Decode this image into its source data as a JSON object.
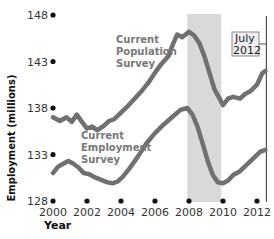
{
  "chart_data": {
    "type": "line",
    "title": "",
    "xlabel": "Year",
    "ylabel": "Employment (millions)",
    "xlim": [
      2000,
      2012.6
    ],
    "ylim": [
      128,
      148
    ],
    "x_ticks": [
      "2000",
      "2002",
      "2004",
      "2006",
      "2008",
      "2010",
      "2012"
    ],
    "y_ticks": [
      "128",
      "133",
      "138",
      "143",
      "148"
    ],
    "grid": false,
    "legend": "inline labels",
    "shaded_region": {
      "from": 2007.9,
      "to": 2009.9,
      "color": "#d9d9d9",
      "meaning": "recession"
    },
    "annotation": {
      "label_line1": "July",
      "label_line2": "2012",
      "x": 2012.55
    },
    "series": [
      {
        "name": "Current Population Survey",
        "label_line1": "Current",
        "label_line2": "Population",
        "label_line3": "Survey",
        "color": "#707070",
        "x": [
          2000.0,
          2000.4,
          2000.8,
          2001.1,
          2001.4,
          2001.7,
          2002.0,
          2002.3,
          2002.6,
          2003.0,
          2003.3,
          2003.6,
          2004.0,
          2004.4,
          2004.8,
          2005.2,
          2005.6,
          2006.0,
          2006.4,
          2006.8,
          2007.0,
          2007.3,
          2007.6,
          2008.0,
          2008.3,
          2008.6,
          2008.9,
          2009.2,
          2009.5,
          2009.8,
          2010.0,
          2010.3,
          2010.6,
          2011.0,
          2011.3,
          2011.6,
          2012.0,
          2012.3,
          2012.5
        ],
        "values": [
          137.0,
          136.6,
          137.0,
          136.5,
          137.3,
          136.5,
          135.8,
          136.0,
          135.6,
          136.1,
          136.6,
          136.8,
          137.5,
          138.2,
          139.0,
          139.8,
          140.7,
          141.8,
          142.8,
          143.6,
          144.6,
          145.9,
          145.6,
          146.2,
          145.8,
          145.0,
          143.6,
          141.8,
          140.0,
          139.0,
          138.3,
          139.0,
          139.2,
          139.0,
          139.5,
          139.8,
          140.5,
          141.7,
          142.0
        ]
      },
      {
        "name": "Current Employment Survey",
        "label_line1": "Current",
        "label_line2": "Employment",
        "label_line3": "Survey",
        "color": "#707070",
        "x": [
          2000.0,
          2000.3,
          2000.6,
          2000.9,
          2001.2,
          2001.5,
          2001.8,
          2002.1,
          2002.4,
          2002.8,
          2003.2,
          2003.5,
          2003.8,
          2004.1,
          2004.5,
          2005.0,
          2005.5,
          2006.0,
          2006.5,
          2007.0,
          2007.5,
          2007.9,
          2008.2,
          2008.5,
          2008.8,
          2009.1,
          2009.4,
          2009.7,
          2010.0,
          2010.3,
          2010.6,
          2011.0,
          2011.4,
          2011.8,
          2012.2,
          2012.5
        ],
        "values": [
          131.0,
          131.7,
          132.0,
          132.3,
          132.0,
          131.6,
          131.0,
          130.9,
          130.6,
          130.3,
          130.0,
          129.9,
          130.1,
          130.6,
          131.5,
          132.8,
          134.2,
          135.3,
          136.2,
          137.0,
          137.8,
          138.0,
          137.3,
          136.0,
          134.2,
          132.3,
          130.8,
          130.0,
          129.9,
          130.2,
          130.8,
          131.2,
          131.9,
          132.6,
          133.3,
          133.5
        ]
      }
    ]
  }
}
